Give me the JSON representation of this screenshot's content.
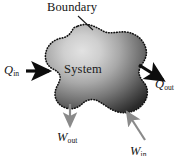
{
  "figure": {
    "background_color": "#ffffff"
  },
  "diagram": {
    "boundary_label": "Boundary",
    "system_label": "System",
    "system_fill_light": "#d9d9d9",
    "system_fill_dark": "#2b2b2b",
    "boundary_stroke": "#101010",
    "boundary_style": "dotted",
    "heat_arrow_color": "#0d0d0d",
    "work_arrow_color": "#8a8a8a",
    "leader_line_color": "#1a1a1a"
  },
  "flows": {
    "q_in": {
      "symbol": "Q",
      "subscript": "in",
      "icon": "arrow-right-icon",
      "direction": "into-system",
      "kind": "heat"
    },
    "q_out": {
      "symbol": "Q",
      "subscript": "out",
      "icon": "arrow-down-right-icon",
      "direction": "out-of-system",
      "kind": "heat"
    },
    "w_out": {
      "symbol": "W",
      "subscript": "out",
      "icon": "arrow-down-icon",
      "direction": "out-of-system",
      "kind": "work"
    },
    "w_in": {
      "symbol": "W",
      "subscript": "in",
      "icon": "arrow-up-left-icon",
      "direction": "into-system",
      "kind": "work"
    }
  }
}
